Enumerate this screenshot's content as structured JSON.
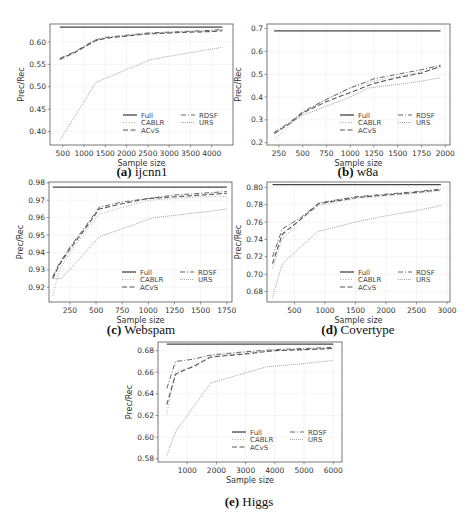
{
  "figure": {
    "legend_labels": [
      "Full",
      "CABLR",
      "ACvS",
      "RDSF",
      "URS"
    ]
  },
  "chart_data": [
    {
      "id": "a",
      "type": "line",
      "caption_letter": "(a)",
      "caption_name": "ijcnn1",
      "xlabel": "Sample size",
      "ylabel": "Prec/Rec",
      "xlim": [
        200,
        4500
      ],
      "ylim": [
        0.37,
        0.64
      ],
      "xticks": [
        500,
        1000,
        1500,
        2000,
        2500,
        3000,
        3500,
        4000
      ],
      "yticks": [
        0.4,
        0.45,
        0.5,
        0.55,
        0.6
      ],
      "ytick_labels": [
        "0.40",
        "0.45",
        "0.50",
        "0.55",
        "0.60"
      ],
      "grid": true,
      "legend_position": "lower right",
      "box": {
        "left": 50,
        "top": 24,
        "width": 183,
        "height": 121
      },
      "caption_pos": {
        "x": 142,
        "y": 164
      },
      "series": [
        {
          "name": "Full",
          "x": [
            430,
            4250
          ],
          "values": [
            0.633,
            0.633
          ]
        },
        {
          "name": "CABLR",
          "x": [
            430,
            800,
            1250,
            1500,
            2000,
            2500,
            3000,
            3500,
            4000,
            4250
          ],
          "values": [
            0.562,
            0.578,
            0.603,
            0.609,
            0.614,
            0.619,
            0.621,
            0.623,
            0.624,
            0.626
          ]
        },
        {
          "name": "ACvS",
          "x": [
            430,
            800,
            1250,
            1500,
            2000,
            2500,
            3000,
            3500,
            4000,
            4250
          ],
          "values": [
            0.561,
            0.577,
            0.602,
            0.608,
            0.613,
            0.618,
            0.62,
            0.622,
            0.623,
            0.625
          ]
        },
        {
          "name": "RDSF",
          "x": [
            430,
            800,
            1250,
            1500,
            2000,
            2500,
            3000,
            3500,
            4000,
            4250
          ],
          "values": [
            0.563,
            0.579,
            0.604,
            0.61,
            0.615,
            0.62,
            0.622,
            0.624,
            0.626,
            0.628
          ]
        },
        {
          "name": "URS",
          "x": [
            430,
            1280,
            2550,
            3000,
            3500,
            4250
          ],
          "values": [
            0.38,
            0.51,
            0.56,
            0.568,
            0.576,
            0.588
          ]
        }
      ]
    },
    {
      "id": "b",
      "type": "line",
      "caption_letter": "(b)",
      "caption_name": "w8a",
      "xlabel": "Sample size",
      "ylabel": "Prec/Rec",
      "xlim": [
        125,
        2050
      ],
      "ylim": [
        0.19,
        0.72
      ],
      "xticks": [
        250,
        500,
        750,
        1000,
        1250,
        1500,
        1750,
        2000
      ],
      "yticks": [
        0.2,
        0.3,
        0.4,
        0.5,
        0.6,
        0.7
      ],
      "ytick_labels": [
        "0.2",
        "0.3",
        "0.4",
        "0.5",
        "0.6",
        "0.7"
      ],
      "grid": true,
      "legend_position": "lower right",
      "box": {
        "left": 267,
        "top": 24,
        "width": 183,
        "height": 121
      },
      "caption_pos": {
        "x": 358,
        "y": 164
      },
      "series": [
        {
          "name": "Full",
          "x": [
            200,
            1950
          ],
          "values": [
            0.69,
            0.69
          ]
        },
        {
          "name": "CABLR",
          "x": [
            200,
            350,
            500,
            750,
            1000,
            1250,
            1500,
            1750,
            1950
          ],
          "values": [
            0.215,
            0.27,
            0.33,
            0.39,
            0.44,
            0.47,
            0.49,
            0.51,
            0.53
          ]
        },
        {
          "name": "ACvS",
          "x": [
            200,
            350,
            500,
            750,
            1000,
            1250,
            1500,
            1750,
            1950
          ],
          "values": [
            0.24,
            0.28,
            0.33,
            0.38,
            0.42,
            0.46,
            0.485,
            0.505,
            0.535
          ]
        },
        {
          "name": "RDSF",
          "x": [
            200,
            350,
            500,
            750,
            1000,
            1250,
            1500,
            1750,
            1950
          ],
          "values": [
            0.245,
            0.285,
            0.335,
            0.39,
            0.44,
            0.48,
            0.5,
            0.52,
            0.54
          ]
        },
        {
          "name": "URS",
          "x": [
            200,
            500,
            750,
            1000,
            1200,
            1500,
            1750,
            1950
          ],
          "values": [
            0.24,
            0.32,
            0.36,
            0.4,
            0.44,
            0.455,
            0.47,
            0.485
          ]
        }
      ]
    },
    {
      "id": "c",
      "type": "line",
      "caption_letter": "(c)",
      "caption_name": "Webspam",
      "xlabel": "Sample size",
      "ylabel": "Prec/Rec",
      "xlim": [
        50,
        1800
      ],
      "ylim": [
        0.9115,
        0.9805
      ],
      "xticks": [
        250,
        500,
        750,
        1000,
        1250,
        1500,
        1750
      ],
      "yticks": [
        0.92,
        0.93,
        0.94,
        0.95,
        0.96,
        0.97,
        0.98
      ],
      "ytick_labels": [
        "0.92",
        "0.93",
        "0.94",
        "0.95",
        "0.96",
        "0.97",
        "0.98"
      ],
      "grid": true,
      "legend_position": "lower right",
      "box": {
        "left": 49,
        "top": 182,
        "width": 183,
        "height": 120
      },
      "caption_pos": {
        "x": 141,
        "y": 322
      },
      "series": [
        {
          "name": "Full",
          "x": [
            85,
            1750
          ],
          "values": [
            0.9775,
            0.9775
          ]
        },
        {
          "name": "CABLR",
          "x": [
            85,
            150,
            250,
            400,
            530,
            750,
            1000,
            1250,
            1500,
            1750
          ],
          "values": [
            0.915,
            0.93,
            0.94,
            0.952,
            0.962,
            0.966,
            0.97,
            0.971,
            0.972,
            0.972
          ]
        },
        {
          "name": "ACvS",
          "x": [
            85,
            150,
            250,
            400,
            530,
            750,
            1000,
            1250,
            1500,
            1750
          ],
          "values": [
            0.925,
            0.933,
            0.942,
            0.954,
            0.965,
            0.968,
            0.971,
            0.972,
            0.973,
            0.974
          ]
        },
        {
          "name": "RDSF",
          "x": [
            85,
            150,
            250,
            400,
            530,
            750,
            1000,
            1250,
            1500,
            1750
          ],
          "values": [
            0.926,
            0.934,
            0.943,
            0.955,
            0.966,
            0.969,
            0.971,
            0.973,
            0.974,
            0.975
          ]
        },
        {
          "name": "URS",
          "x": [
            85,
            170,
            530,
            1050,
            1500,
            1750
          ],
          "values": [
            0.925,
            0.925,
            0.949,
            0.96,
            0.963,
            0.965
          ]
        }
      ]
    },
    {
      "id": "d",
      "type": "line",
      "caption_letter": "(d)",
      "caption_name": "Covertype",
      "xlabel": "Sample size",
      "ylabel": "Prec/Rec",
      "xlim": [
        50,
        3050
      ],
      "ylim": [
        0.668,
        0.806
      ],
      "xticks": [
        500,
        1000,
        1500,
        2000,
        2500,
        3000
      ],
      "yticks": [
        0.68,
        0.7,
        0.72,
        0.74,
        0.76,
        0.78,
        0.8
      ],
      "ytick_labels": [
        "0.68",
        "0.70",
        "0.72",
        "0.74",
        "0.76",
        "0.78",
        "0.80"
      ],
      "grid": true,
      "legend_position": "lower right",
      "box": {
        "left": 267,
        "top": 182,
        "width": 183,
        "height": 120
      },
      "caption_pos": {
        "x": 358,
        "y": 322
      },
      "series": [
        {
          "name": "Full",
          "x": [
            140,
            2900
          ],
          "values": [
            0.803,
            0.803
          ]
        },
        {
          "name": "CABLR",
          "x": [
            140,
            300,
            600,
            900,
            1500,
            2000,
            2500,
            2900
          ],
          "values": [
            0.707,
            0.74,
            0.763,
            0.779,
            0.787,
            0.79,
            0.793,
            0.796
          ]
        },
        {
          "name": "ACvS",
          "x": [
            140,
            300,
            600,
            900,
            1500,
            2000,
            2500,
            2900
          ],
          "values": [
            0.712,
            0.746,
            0.763,
            0.781,
            0.788,
            0.791,
            0.794,
            0.797
          ]
        },
        {
          "name": "RDSF",
          "x": [
            140,
            300,
            600,
            900,
            1500,
            2000,
            2500,
            2900
          ],
          "values": [
            0.72,
            0.752,
            0.765,
            0.782,
            0.789,
            0.792,
            0.795,
            0.798
          ]
        },
        {
          "name": "URS",
          "x": [
            140,
            300,
            880,
            1500,
            2000,
            2500,
            2900
          ],
          "values": [
            0.673,
            0.712,
            0.749,
            0.76,
            0.767,
            0.773,
            0.779
          ]
        }
      ]
    },
    {
      "id": "e",
      "type": "line",
      "caption_letter": "(e)",
      "caption_name": "Higgs",
      "xlabel": "Sample size",
      "ylabel": "Prec/Rec",
      "xlim": [
        0,
        6300
      ],
      "ylim": [
        0.577,
        0.688
      ],
      "xticks": [
        1000,
        2000,
        3000,
        4000,
        5000,
        6000
      ],
      "yticks": [
        0.58,
        0.6,
        0.62,
        0.64,
        0.66,
        0.68
      ],
      "ytick_labels": [
        "0.58",
        "0.60",
        "0.62",
        "0.64",
        "0.66",
        "0.68"
      ],
      "grid": true,
      "legend_position": "lower right",
      "box": {
        "left": 158,
        "top": 342,
        "width": 184,
        "height": 120
      },
      "caption_pos": {
        "x": 249,
        "y": 494
      },
      "series": [
        {
          "name": "Full",
          "x": [
            300,
            6000
          ],
          "values": [
            0.686,
            0.686
          ]
        },
        {
          "name": "CABLR",
          "x": [
            300,
            600,
            900,
            1200,
            1800,
            3000,
            4000,
            5000,
            6000
          ],
          "values": [
            0.622,
            0.66,
            0.663,
            0.666,
            0.675,
            0.678,
            0.68,
            0.681,
            0.682
          ]
        },
        {
          "name": "ACvS",
          "x": [
            300,
            600,
            900,
            1200,
            1800,
            3000,
            4000,
            5000,
            6000
          ],
          "values": [
            0.63,
            0.658,
            0.662,
            0.665,
            0.674,
            0.677,
            0.68,
            0.681,
            0.682
          ]
        },
        {
          "name": "RDSF",
          "x": [
            300,
            600,
            900,
            1200,
            1800,
            3000,
            4000,
            5000,
            6000
          ],
          "values": [
            0.645,
            0.67,
            0.671,
            0.672,
            0.676,
            0.679,
            0.681,
            0.682,
            0.683
          ]
        },
        {
          "name": "URS",
          "x": [
            300,
            600,
            1800,
            3700,
            5000,
            6000
          ],
          "values": [
            0.583,
            0.605,
            0.65,
            0.665,
            0.668,
            0.671
          ]
        }
      ]
    }
  ]
}
